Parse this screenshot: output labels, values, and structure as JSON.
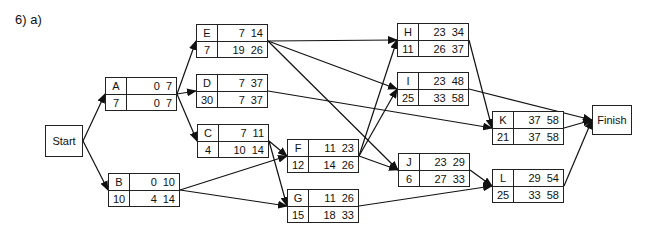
{
  "title": "6)  a)",
  "terminals": {
    "start": {
      "label": "Start",
      "x": 45,
      "y": 125,
      "w": 38,
      "h": 32
    },
    "finish": {
      "label": "Finish",
      "x": 592,
      "y": 105,
      "w": 40,
      "h": 30
    }
  },
  "nodes": [
    {
      "id": "A",
      "dur": "7",
      "es": "0",
      "ef": "7",
      "ls": "0",
      "lf": "7",
      "x": 105,
      "y": 77
    },
    {
      "id": "B",
      "dur": "10",
      "es": "0",
      "ef": "10",
      "ls": "4",
      "lf": "14",
      "x": 108,
      "y": 173
    },
    {
      "id": "C",
      "dur": "4",
      "es": "7",
      "ef": "11",
      "ls": "10",
      "lf": "14",
      "x": 197,
      "y": 124
    },
    {
      "id": "D",
      "dur": "30",
      "es": "7",
      "ef": "37",
      "ls": "7",
      "lf": "37",
      "x": 196,
      "y": 74
    },
    {
      "id": "E",
      "dur": "7",
      "es": "7",
      "ef": "14",
      "ls": "19",
      "lf": "26",
      "x": 196,
      "y": 24
    },
    {
      "id": "F",
      "dur": "12",
      "es": "11",
      "ef": "23",
      "ls": "14",
      "lf": "26",
      "x": 287,
      "y": 139
    },
    {
      "id": "G",
      "dur": "15",
      "es": "11",
      "ef": "26",
      "ls": "18",
      "lf": "33",
      "x": 287,
      "y": 189
    },
    {
      "id": "H",
      "dur": "11",
      "es": "23",
      "ef": "34",
      "ls": "26",
      "lf": "37",
      "x": 397,
      "y": 23
    },
    {
      "id": "I",
      "dur": "25",
      "es": "23",
      "ef": "48",
      "ls": "33",
      "lf": "58",
      "x": 397,
      "y": 72
    },
    {
      "id": "J",
      "dur": "6",
      "es": "23",
      "ef": "29",
      "ls": "27",
      "lf": "33",
      "x": 398,
      "y": 153
    },
    {
      "id": "K",
      "dur": "21",
      "es": "37",
      "ef": "58",
      "ls": "37",
      "lf": "58",
      "x": 492,
      "y": 111
    },
    {
      "id": "L",
      "dur": "25",
      "es": "29",
      "ef": "54",
      "ls": "33",
      "lf": "58",
      "x": 492,
      "y": 169
    }
  ],
  "edges": [
    [
      "Start",
      "A"
    ],
    [
      "Start",
      "B"
    ],
    [
      "A",
      "E"
    ],
    [
      "A",
      "D"
    ],
    [
      "A",
      "C"
    ],
    [
      "B",
      "F"
    ],
    [
      "B",
      "G"
    ],
    [
      "C",
      "F"
    ],
    [
      "C",
      "G"
    ],
    [
      "E",
      "H"
    ],
    [
      "E",
      "I"
    ],
    [
      "E",
      "J"
    ],
    [
      "D",
      "K"
    ],
    [
      "F",
      "H"
    ],
    [
      "F",
      "I"
    ],
    [
      "F",
      "J"
    ],
    [
      "G",
      "L"
    ],
    [
      "H",
      "K"
    ],
    [
      "I",
      "Finish"
    ],
    [
      "J",
      "L"
    ],
    [
      "K",
      "Finish"
    ],
    [
      "L",
      "Finish"
    ]
  ]
}
